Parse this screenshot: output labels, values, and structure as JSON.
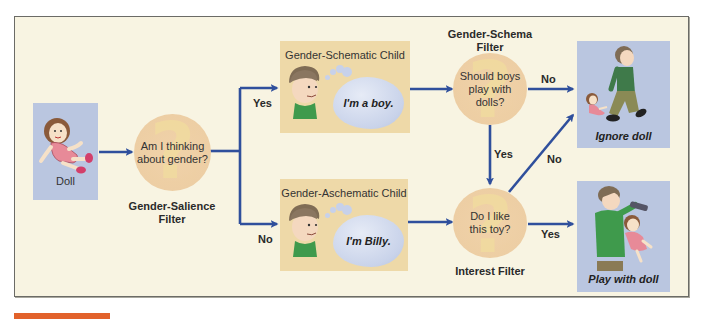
{
  "diagram": {
    "type": "flowchart",
    "title": "",
    "colors": {
      "frame_bg": "#f8f4e2",
      "frame_border": "#6b6b66",
      "blue_box": "#bac6e0",
      "tan_box": "#eed9a8",
      "filter_circle": "#edcea4",
      "arrow": "#2f4f9c",
      "accent_bar": "#e2622b"
    },
    "start": {
      "label": "Doll",
      "icon": "doll-illustration"
    },
    "salience_filter": {
      "question": [
        "Am I thinking",
        "about gender?"
      ],
      "caption": [
        "Gender-Salience",
        "Filter"
      ]
    },
    "branches": {
      "yes": "Yes",
      "no": "No"
    },
    "schematic_child": {
      "title": "Gender-Schematic Child",
      "thought": "I'm a boy.",
      "icon": "boy-thinking-illustration"
    },
    "aschematic_child": {
      "title": "Gender-Aschematic Child",
      "thought": "I'm Billy.",
      "icon": "boy-thinking-illustration"
    },
    "schema_filter": {
      "caption": [
        "Gender-Schema",
        "Filter"
      ],
      "question": [
        "Should boys",
        "play with dolls?"
      ],
      "no_label": "No",
      "yes_label": "Yes"
    },
    "interest_filter": {
      "question": [
        "Do I like",
        "this toy?"
      ],
      "caption": "Interest Filter",
      "no_label": "No",
      "yes_label": "Yes"
    },
    "outcomes": {
      "ignore": {
        "label": "Ignore doll",
        "icon": "boy-walking-away-illustration"
      },
      "play": {
        "label": "Play with doll",
        "icon": "boy-brushing-doll-hair-illustration"
      }
    },
    "edges": [
      {
        "from": "Doll",
        "to": "Gender-Salience Filter",
        "label": ""
      },
      {
        "from": "Gender-Salience Filter",
        "to": "Gender-Schematic Child",
        "label": "Yes"
      },
      {
        "from": "Gender-Salience Filter",
        "to": "Gender-Aschematic Child",
        "label": "No"
      },
      {
        "from": "Gender-Schematic Child",
        "to": "Gender-Schema Filter",
        "label": ""
      },
      {
        "from": "Gender-Schema Filter",
        "to": "Ignore doll",
        "label": "No"
      },
      {
        "from": "Gender-Schema Filter",
        "to": "Interest Filter",
        "label": "Yes"
      },
      {
        "from": "Gender-Aschematic Child",
        "to": "Interest Filter",
        "label": ""
      },
      {
        "from": "Interest Filter",
        "to": "Ignore doll",
        "label": "No"
      },
      {
        "from": "Interest Filter",
        "to": "Play with doll",
        "label": "Yes"
      }
    ]
  }
}
